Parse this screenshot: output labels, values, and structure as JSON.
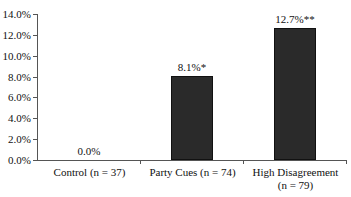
{
  "chart_data": {
    "type": "bar",
    "title": "",
    "xlabel": "",
    "ylabel": "",
    "categories": [
      "Control (n = 37)",
      "Party Cues (n = 74)",
      "High Disagreement (n = 79)"
    ],
    "category_lines": [
      [
        "Control (n = 37)"
      ],
      [
        "Party Cues (n = 74)"
      ],
      [
        "High Disagreement",
        "(n = 79)"
      ]
    ],
    "values": [
      0.0,
      8.1,
      12.7
    ],
    "value_labels": [
      "0.0%",
      "8.1%*",
      "12.7%**"
    ],
    "ylim": [
      0,
      14
    ],
    "yticks": [
      "0.0%",
      "2.0%",
      "4.0%",
      "6.0%",
      "8.0%",
      "10.0%",
      "12.0%",
      "14.0%"
    ],
    "grid": false,
    "legend": null,
    "bar_color": "#2a2a2a"
  }
}
